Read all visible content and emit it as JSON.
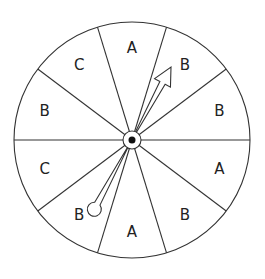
{
  "spinner": {
    "center": [
      132,
      140
    ],
    "radius": 118,
    "line_color": "#333333",
    "sectors": [
      {
        "label": "B",
        "start": 0,
        "end": 37
      },
      {
        "label": "B",
        "start": 37,
        "end": 73
      },
      {
        "label": "A",
        "start": 73,
        "end": 107
      },
      {
        "label": "C",
        "start": 107,
        "end": 143
      },
      {
        "label": "B",
        "start": 143,
        "end": 180
      },
      {
        "label": "C",
        "start": 180,
        "end": 217
      },
      {
        "label": "B",
        "start": 217,
        "end": 253
      },
      {
        "label": "A",
        "start": 253,
        "end": 287
      },
      {
        "label": "B",
        "start": 287,
        "end": 323
      },
      {
        "label": "A",
        "start": 323,
        "end": 360
      }
    ],
    "pointer": {
      "tip": [
        171,
        67
      ],
      "tail": [
        95,
        208
      ]
    }
  }
}
